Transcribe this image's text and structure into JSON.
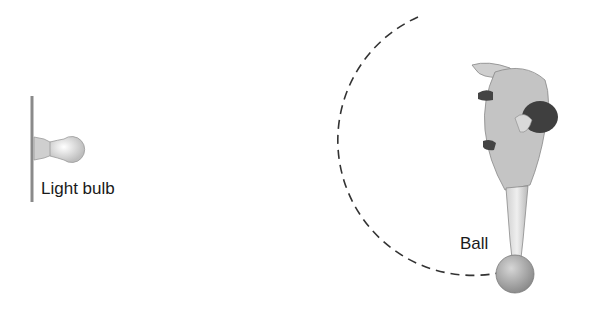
{
  "diagram": {
    "labels": {
      "light_bulb": "Light bulb",
      "ball": "Ball"
    },
    "elements": [
      {
        "name": "wall",
        "type": "vertical-line"
      },
      {
        "name": "light-bulb",
        "type": "bulb-icon"
      },
      {
        "name": "ball-path",
        "type": "dashed-arc"
      },
      {
        "name": "person",
        "type": "top-view-figure"
      },
      {
        "name": "ball",
        "type": "sphere"
      }
    ],
    "colors": {
      "wall": "#888888",
      "dash": "#333333",
      "figure_fill": "#bdbdbd",
      "hair": "#3a3a3a",
      "ball": "#a8a8a8"
    }
  }
}
